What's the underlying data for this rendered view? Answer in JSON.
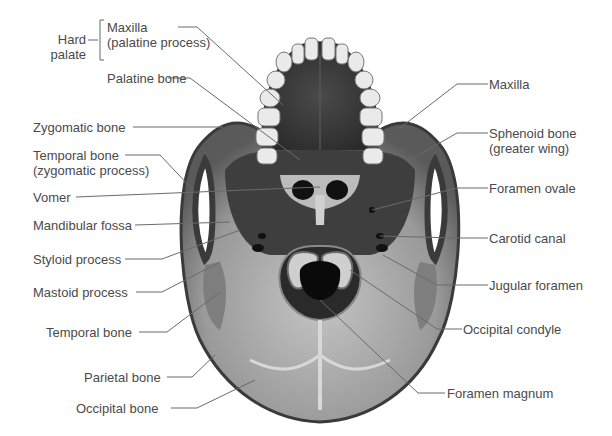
{
  "figure": {
    "group_labels": {
      "hard_palate_line1": "Hard",
      "hard_palate_line2": "palate"
    },
    "left_labels": {
      "maxilla_palatine_line1": "Maxilla",
      "maxilla_palatine_line2": "(palatine process)",
      "palatine_bone": "Palatine bone",
      "zygomatic_bone": "Zygomatic bone",
      "temporal_zygomatic_line1": "Temporal bone",
      "temporal_zygomatic_line2": "(zygomatic process)",
      "vomer": "Vomer",
      "mandibular_fossa": "Mandibular fossa",
      "styloid_process": "Styloid process",
      "mastoid_process": "Mastoid process",
      "temporal_bone": "Temporal bone",
      "parietal_bone": "Parietal bone",
      "occipital_bone": "Occipital bone"
    },
    "right_labels": {
      "maxilla": "Maxilla",
      "sphenoid_line1": "Sphenoid bone",
      "sphenoid_line2": "(greater wing)",
      "foramen_ovale": "Foramen ovale",
      "carotid_canal": "Carotid canal",
      "jugular_foramen": "Jugular foramen",
      "occipital_condyle": "Occipital condyle",
      "foramen_magnum": "Foramen magnum"
    },
    "colors": {
      "label_text": "#4a4a4a",
      "leader_line": "#6a6a6a",
      "bone_light": "#b8b8b8",
      "bone_dark": "#3a3a3a",
      "tooth": "#eeeeee"
    }
  }
}
